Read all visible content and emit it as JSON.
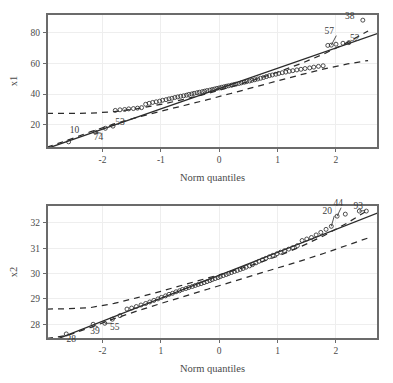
{
  "figure": {
    "background": "#ffffff",
    "ink_color": "#2b2b2b",
    "grid_color": "#eeeeee",
    "frame_color": "#6b6b6b"
  },
  "chart_data": [
    {
      "id": "top",
      "type": "scatter",
      "title": "",
      "subtitle": "",
      "xlabel": "Norm quantiles",
      "ylabel": "x1",
      "xlim": [
        -2.95,
        2.72
      ],
      "ylim": [
        5.0,
        92.0
      ],
      "xticks": [
        -2,
        -1,
        0,
        1,
        2
      ],
      "xticklabels": [
        "-2",
        "-1",
        "0",
        "1",
        "2"
      ],
      "yticks": [
        20,
        40,
        60,
        80
      ],
      "yticklabels": [
        "20",
        "40",
        "60",
        "80"
      ],
      "grid": true,
      "legend": "none",
      "reference_line": {
        "label": "normal reference line",
        "style": "solid",
        "intercept": 43.6,
        "slope": 13.2
      },
      "envelope": {
        "label": "pointwise confidence envelope",
        "style": "dashed",
        "upper": [
          [
            -2.95,
            27.5
          ],
          [
            -2.6,
            27.5
          ],
          [
            -2.2,
            27.6
          ],
          [
            -1.8,
            28.6
          ],
          [
            -1.4,
            30.6
          ],
          [
            -1.0,
            33.3
          ],
          [
            -0.6,
            36.6
          ],
          [
            -0.2,
            40.4
          ],
          [
            0.2,
            44.6
          ],
          [
            0.6,
            49.2
          ],
          [
            1.0,
            54.2
          ],
          [
            1.4,
            59.8
          ],
          [
            1.8,
            66.2
          ],
          [
            2.2,
            73.6
          ],
          [
            2.55,
            81.0
          ]
        ],
        "lower": [
          [
            -2.95,
            5.5
          ],
          [
            -2.6,
            10.0
          ],
          [
            -2.2,
            15.6
          ],
          [
            -1.8,
            20.6
          ],
          [
            -1.4,
            25.0
          ],
          [
            -1.0,
            28.9
          ],
          [
            -0.6,
            32.6
          ],
          [
            -0.2,
            36.4
          ],
          [
            0.2,
            40.4
          ],
          [
            0.6,
            44.5
          ],
          [
            1.0,
            48.6
          ],
          [
            1.4,
            52.6
          ],
          [
            1.8,
            56.4
          ],
          [
            2.2,
            59.6
          ],
          [
            2.55,
            61.8
          ]
        ]
      },
      "n_points": 100,
      "points": [
        [
          -2.58,
          9.0
        ],
        [
          -2.12,
          15.2
        ],
        [
          -1.95,
          17.8
        ],
        [
          -1.82,
          19.2
        ],
        [
          -1.78,
          29.4
        ],
        [
          -1.7,
          29.8
        ],
        [
          -1.62,
          30.0
        ],
        [
          -1.55,
          30.4
        ],
        [
          -1.47,
          30.6
        ],
        [
          -1.4,
          30.9
        ],
        [
          -1.33,
          31.2
        ],
        [
          -1.26,
          33.4
        ],
        [
          -1.2,
          34.0
        ],
        [
          -1.14,
          34.6
        ],
        [
          -1.08,
          35.0
        ],
        [
          -1.02,
          35.4
        ],
        [
          -0.97,
          36.0
        ],
        [
          -0.91,
          36.4
        ],
        [
          -0.86,
          36.9
        ],
        [
          -0.81,
          37.3
        ],
        [
          -0.76,
          37.8
        ],
        [
          -0.71,
          38.2
        ],
        [
          -0.66,
          38.6
        ],
        [
          -0.61,
          38.9
        ],
        [
          -0.56,
          39.3
        ],
        [
          -0.52,
          39.8
        ],
        [
          -0.47,
          40.1
        ],
        [
          -0.43,
          40.5
        ],
        [
          -0.38,
          40.9
        ],
        [
          -0.34,
          41.2
        ],
        [
          -0.29,
          41.6
        ],
        [
          -0.25,
          41.9
        ],
        [
          -0.21,
          42.3
        ],
        [
          -0.16,
          42.6
        ],
        [
          -0.12,
          43.0
        ],
        [
          -0.08,
          43.3
        ],
        [
          -0.04,
          43.7
        ],
        [
          0.0,
          44.0
        ],
        [
          0.04,
          44.4
        ],
        [
          0.08,
          44.7
        ],
        [
          0.12,
          45.1
        ],
        [
          0.16,
          45.4
        ],
        [
          0.21,
          45.8
        ],
        [
          0.25,
          46.2
        ],
        [
          0.29,
          46.5
        ],
        [
          0.34,
          46.9
        ],
        [
          0.38,
          47.3
        ],
        [
          0.43,
          47.7
        ],
        [
          0.47,
          48.1
        ],
        [
          0.52,
          48.5
        ],
        [
          0.56,
          48.9
        ],
        [
          0.61,
          49.3
        ],
        [
          0.66,
          49.8
        ],
        [
          0.71,
          50.3
        ],
        [
          0.76,
          50.8
        ],
        [
          0.81,
          51.4
        ],
        [
          0.86,
          52.0
        ],
        [
          0.91,
          52.4
        ],
        [
          0.97,
          52.9
        ],
        [
          1.02,
          53.4
        ],
        [
          1.08,
          53.9
        ],
        [
          1.14,
          54.3
        ],
        [
          1.2,
          54.8
        ],
        [
          1.26,
          55.2
        ],
        [
          1.33,
          55.7
        ],
        [
          1.4,
          56.1
        ],
        [
          1.47,
          56.6
        ],
        [
          1.55,
          57.0
        ],
        [
          1.62,
          57.5
        ],
        [
          1.7,
          58.0
        ],
        [
          1.78,
          58.4
        ],
        [
          1.86,
          71.6
        ],
        [
          1.92,
          71.8
        ],
        [
          2.0,
          72.4
        ],
        [
          2.12,
          73.0
        ],
        [
          2.22,
          73.4
        ],
        [
          2.46,
          88.0
        ]
      ],
      "annotations": [
        {
          "label": "38",
          "x": 2.46,
          "y": 88.0,
          "text_dx": -13,
          "text_dy": -1,
          "leader": false
        },
        {
          "label": "57",
          "x": 1.92,
          "y": 71.8,
          "text_dx": -2,
          "text_dy": -11,
          "leader": true
        },
        {
          "label": "52",
          "x": 2.22,
          "y": 73.4,
          "text_dx": 6,
          "text_dy": -2,
          "leader": true
        },
        {
          "label": "10",
          "x": -2.58,
          "y": 9.0,
          "text_dx": 6,
          "text_dy": -9,
          "leader": false
        },
        {
          "label": "74",
          "x": -2.12,
          "y": 15.2,
          "text_dx": 3,
          "text_dy": 8,
          "leader": true
        },
        {
          "label": "53",
          "x": -1.82,
          "y": 19.2,
          "text_dx": 7,
          "text_dy": -1,
          "leader": false
        }
      ]
    },
    {
      "id": "bottom",
      "type": "scatter",
      "title": "",
      "subtitle": "",
      "xlabel": "Norm quantiles",
      "ylabel": "x2",
      "xlim": [
        -2.95,
        2.72
      ],
      "ylim": [
        27.42,
        32.7
      ],
      "xticks": [
        -2,
        -1,
        0,
        1,
        2
      ],
      "xticklabels": [
        "-2",
        "1",
        "0",
        "1",
        "2"
      ],
      "yticks": [
        28,
        29,
        30,
        31,
        32
      ],
      "yticklabels": [
        "28",
        "29",
        "30",
        "31",
        "32"
      ],
      "grid": true,
      "legend": "none",
      "reference_line": {
        "label": "normal reference line",
        "style": "solid",
        "intercept": 29.93,
        "slope": 0.905
      },
      "envelope": {
        "label": "pointwise confidence envelope",
        "style": "dashed",
        "upper": [
          [
            -2.95,
            28.6
          ],
          [
            -2.6,
            28.61
          ],
          [
            -2.2,
            28.66
          ],
          [
            -1.8,
            28.82
          ],
          [
            -1.4,
            29.05
          ],
          [
            -1.0,
            29.3
          ],
          [
            -0.6,
            29.56
          ],
          [
            -0.2,
            29.82
          ],
          [
            0.2,
            30.08
          ],
          [
            0.6,
            30.36
          ],
          [
            1.0,
            30.68
          ],
          [
            1.4,
            31.06
          ],
          [
            1.8,
            31.5
          ],
          [
            2.2,
            32.0
          ],
          [
            2.55,
            32.5
          ]
        ],
        "lower": [
          [
            -2.95,
            27.44
          ],
          [
            -2.6,
            27.56
          ],
          [
            -2.2,
            27.88
          ],
          [
            -1.8,
            28.22
          ],
          [
            -1.4,
            28.53
          ],
          [
            -1.0,
            28.82
          ],
          [
            -0.6,
            29.1
          ],
          [
            -0.2,
            29.38
          ],
          [
            0.2,
            29.66
          ],
          [
            0.6,
            29.94
          ],
          [
            1.0,
            30.22
          ],
          [
            1.4,
            30.5
          ],
          [
            1.8,
            30.8
          ],
          [
            2.2,
            31.12
          ],
          [
            2.55,
            31.4
          ]
        ]
      },
      "n_points": 100,
      "points": [
        [
          -2.62,
          27.62
        ],
        [
          -2.16,
          28.0
        ],
        [
          -1.96,
          28.04
        ],
        [
          -1.83,
          28.2
        ],
        [
          -1.7,
          28.34
        ],
        [
          -1.58,
          28.6
        ],
        [
          -1.5,
          28.64
        ],
        [
          -1.42,
          28.7
        ],
        [
          -1.34,
          28.76
        ],
        [
          -1.26,
          28.82
        ],
        [
          -1.19,
          28.88
        ],
        [
          -1.12,
          28.94
        ],
        [
          -1.05,
          29.0
        ],
        [
          -0.99,
          29.06
        ],
        [
          -0.92,
          29.12
        ],
        [
          -0.86,
          29.18
        ],
        [
          -0.8,
          29.22
        ],
        [
          -0.74,
          29.28
        ],
        [
          -0.68,
          29.32
        ],
        [
          -0.63,
          29.37
        ],
        [
          -0.57,
          29.41
        ],
        [
          -0.52,
          29.45
        ],
        [
          -0.46,
          29.49
        ],
        [
          -0.41,
          29.53
        ],
        [
          -0.36,
          29.57
        ],
        [
          -0.31,
          29.6
        ],
        [
          -0.26,
          29.64
        ],
        [
          -0.21,
          29.68
        ],
        [
          -0.16,
          29.72
        ],
        [
          -0.12,
          29.76
        ],
        [
          -0.07,
          29.8
        ],
        [
          -0.02,
          29.84
        ],
        [
          0.02,
          29.88
        ],
        [
          0.07,
          29.92
        ],
        [
          0.12,
          29.96
        ],
        [
          0.16,
          30.0
        ],
        [
          0.21,
          30.04
        ],
        [
          0.26,
          30.08
        ],
        [
          0.31,
          30.12
        ],
        [
          0.36,
          30.16
        ],
        [
          0.41,
          30.2
        ],
        [
          0.46,
          30.25
        ],
        [
          0.52,
          30.3
        ],
        [
          0.57,
          30.35
        ],
        [
          0.63,
          30.42
        ],
        [
          0.68,
          30.48
        ],
        [
          0.74,
          30.54
        ],
        [
          0.8,
          30.6
        ],
        [
          0.86,
          30.66
        ],
        [
          0.92,
          30.72
        ],
        [
          0.99,
          30.78
        ],
        [
          1.05,
          30.84
        ],
        [
          1.12,
          30.9
        ],
        [
          1.19,
          30.96
        ],
        [
          1.26,
          31.02
        ],
        [
          1.34,
          31.1
        ],
        [
          1.42,
          31.3
        ],
        [
          1.5,
          31.36
        ],
        [
          1.58,
          31.42
        ],
        [
          1.66,
          31.52
        ],
        [
          1.74,
          31.62
        ],
        [
          1.83,
          31.74
        ],
        [
          1.92,
          31.86
        ],
        [
          2.02,
          32.26
        ],
        [
          2.16,
          32.34
        ],
        [
          2.4,
          32.46
        ],
        [
          2.52,
          32.46
        ]
      ],
      "annotations": [
        {
          "label": "20",
          "x": 1.92,
          "y": 31.86,
          "text_dx": -4,
          "text_dy": -12,
          "leader": true
        },
        {
          "label": "44",
          "x": 2.02,
          "y": 32.26,
          "text_dx": 1,
          "text_dy": -10,
          "leader": true
        },
        {
          "label": "93",
          "x": 2.4,
          "y": 32.46,
          "text_dx": -1,
          "text_dy": -2,
          "leader": true
        },
        {
          "label": "28",
          "x": -2.62,
          "y": 27.62,
          "text_dx": 5,
          "text_dy": 8,
          "leader": false
        },
        {
          "label": "39",
          "x": -2.16,
          "y": 28.0,
          "text_dx": 2,
          "text_dy": 10,
          "leader": true
        },
        {
          "label": "55",
          "x": -1.96,
          "y": 28.04,
          "text_dx": 10,
          "text_dy": 7,
          "leader": true
        }
      ]
    }
  ]
}
